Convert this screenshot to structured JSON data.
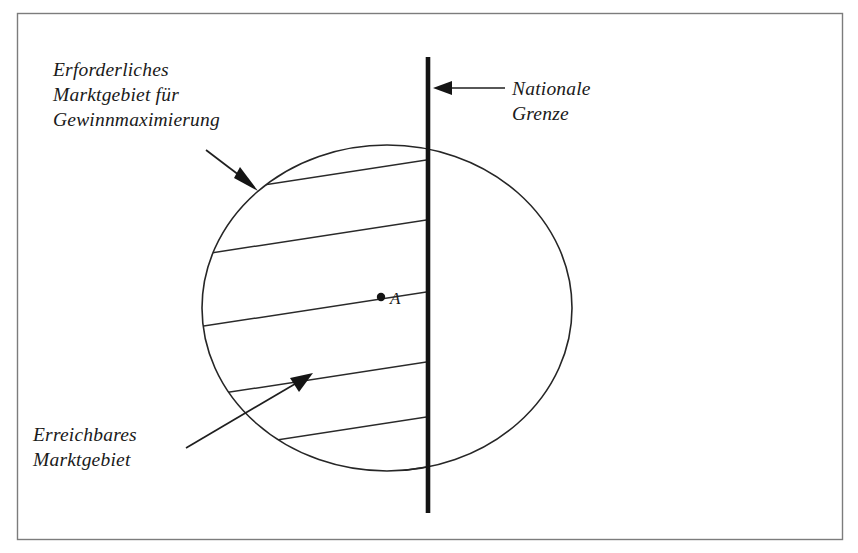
{
  "figure": {
    "background_color": "#ffffff",
    "ink_color": "#1a1a1a",
    "frame_color": "#7c7c7c"
  },
  "labels": {
    "required_market_area": {
      "lines": [
        "Erforderliches",
        "Marktgebiet für",
        "Gewinnmaximierung"
      ],
      "line1": "Erforderliches",
      "line2": "Marktgebiet für",
      "line3": "Gewinnmaximierung"
    },
    "national_border": {
      "lines": [
        "Nationale",
        "Grenze"
      ],
      "line1": "Nationale",
      "line2": "Grenze"
    },
    "reachable_market_area": {
      "lines": [
        "Erreichbares",
        "Marktgebiet"
      ],
      "line1": "Erreichbares",
      "line2": "Marktgebiet"
    },
    "center_point": "A"
  },
  "diagram_data": {
    "type": "diagram",
    "shapes": {
      "circle": {
        "name": "required-market-area-circle",
        "center_x": 387,
        "center_y": 308,
        "radius_x": 185,
        "radius_y": 163,
        "meaning": "Erforderliches Marktgebiet für Gewinnmaximierung"
      },
      "border_line": {
        "name": "national-border-line",
        "x": 428,
        "y_top": 57,
        "y_bottom": 513,
        "thickness": 4.6,
        "meaning": "Nationale Grenze"
      },
      "center_marker": {
        "name": "center-point-a",
        "x": 381,
        "y": 297,
        "label": "A"
      },
      "hatched_region": {
        "name": "reachable-market-area-hatching",
        "meaning": "Erreichbares Marktgebiet",
        "angle_degrees": -14,
        "line_count": 6,
        "border_intercepts_y": [
          158,
          218,
          290,
          360,
          415,
          465
        ],
        "clip": "left half of circle, bounded east by national border"
      }
    },
    "annotations": [
      {
        "name": "required-market-area-arrow",
        "from_x": 208,
        "from_y": 152,
        "to_x": 258,
        "to_y": 190,
        "points_to": "circle outline"
      },
      {
        "name": "national-border-arrow",
        "from_x": 500,
        "from_y": 88,
        "to_x": 436,
        "to_y": 88,
        "points_to": "national border line"
      },
      {
        "name": "reachable-market-area-arrow",
        "from_x": 190,
        "from_y": 446,
        "to_x": 312,
        "to_y": 374,
        "points_to": "hatched region"
      }
    ]
  }
}
